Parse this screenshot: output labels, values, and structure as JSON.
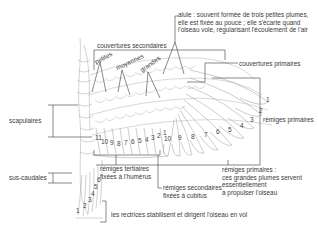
{
  "diagram": {
    "labels": {
      "alule": "alule : souvent formée de trois petites plumes, elle est fixée au pouce ; elle s'écarte quand l'oiseau vole, régularisant l'écoulement de l'air",
      "alule_line1": "alule : souvent formée de trois petites plumes,",
      "alule_line2": "elle est fixée au pouce ; elle s'écarte quand",
      "alule_line3": "l'oiseau vole, régularisant l'écoulement de l'air",
      "couvertures_secondaires": "couvertures secondaires",
      "petites": "petites",
      "moyennes": "moyennes",
      "grandes": "grandes",
      "couvertures_primaires": "couvertures primaires",
      "remiges_primaires": "rémiges primaires",
      "scapulaires": "scapulaires",
      "sus_caudales": "sus-caudales",
      "remiges_tertiaires_line1": "rémiges tertiaires",
      "remiges_tertiaires_line2": "fixées à l'humérus",
      "remiges_secondaires_line1": "rémiges secondaires",
      "remiges_secondaires_line2": "fixées à cubitus",
      "remiges_primaires_desc_line1": "rémiges primaires :",
      "remiges_primaires_desc_line2": "ces grandes plumes servent",
      "remiges_primaires_desc_line3": "essentiellement",
      "remiges_primaires_desc_line4": "à propulser l'oiseau",
      "rectrices": "les rectrices stabilisent et dirigent l'oiseau en vol"
    },
    "primary_feather_numbers": [
      "1",
      "2",
      "3",
      "4",
      "5",
      "6",
      "7",
      "8",
      "9",
      "10"
    ],
    "secondary_feather_numbers": [
      "11",
      "10",
      "9",
      "8",
      "7",
      "6",
      "5",
      "4",
      "3",
      "2",
      "1"
    ],
    "tail_feather_numbers": [
      "1",
      "2",
      "3",
      "4",
      "5",
      "6"
    ],
    "colors": {
      "line": "#3a3a3a",
      "feather_stroke": "#9a9a9a",
      "background": "#ffffff"
    }
  }
}
